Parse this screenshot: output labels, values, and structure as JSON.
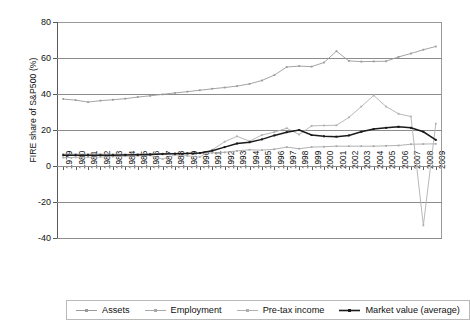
{
  "chart_data": {
    "type": "line",
    "title": "",
    "xlabel": "",
    "ylabel": "FIRE share of S&P500 (%)",
    "ylim": [
      -40,
      80
    ],
    "yticks": [
      80,
      60,
      40,
      20,
      0,
      -20,
      -40
    ],
    "grid": true,
    "legend_position": "bottom",
    "x": [
      1979,
      1980,
      1981,
      1982,
      1983,
      1984,
      1985,
      1986,
      1987,
      1988,
      1989,
      1990,
      1991,
      1992,
      1993,
      1994,
      1995,
      1996,
      1997,
      1998,
      1999,
      2000,
      2001,
      2002,
      2003,
      2004,
      2005,
      2006,
      2007,
      2008,
      2009
    ],
    "categories": [
      "1979",
      "1980",
      "1981",
      "1982",
      "1983",
      "1984",
      "1985",
      "1986",
      "1987",
      "1988",
      "1989",
      "1990",
      "1991",
      "1992",
      "1993",
      "1994",
      "1995",
      "1996",
      "1997",
      "1998",
      "1999",
      "2000",
      "2001",
      "2002",
      "2003",
      "2004",
      "2005",
      "2006",
      "2007",
      "2008",
      "2009"
    ],
    "series": [
      {
        "name": "Assets",
        "color": "#9a9a9a",
        "values": [
          37.2,
          36.6,
          35.5,
          36.3,
          36.8,
          37.4,
          38.3,
          39.0,
          39.8,
          40.6,
          41.3,
          42.1,
          42.9,
          43.6,
          44.4,
          45.6,
          47.5,
          50.5,
          55.0,
          55.5,
          55.2,
          57.5,
          63.8,
          58.4,
          58.0,
          58.1,
          58.2,
          60.6,
          62.5,
          64.6,
          66.4
        ]
      },
      {
        "name": "Employment",
        "color": "#a8a8a8",
        "values": [
          6.6,
          6.6,
          6.6,
          6.6,
          6.5,
          6.5,
          6.6,
          6.8,
          6.9,
          7.0,
          7.0,
          7.1,
          7.3,
          7.6,
          8.4,
          9.0,
          8.8,
          9.3,
          10.5,
          9.6,
          10.5,
          10.7,
          11.0,
          11.0,
          11.0,
          11.0,
          11.2,
          11.4,
          12.1,
          12.2,
          12.3
        ]
      },
      {
        "name": "Pre-tax income",
        "color": "#b0b0b0",
        "values": [
          4.6,
          4.8,
          4.9,
          5.0,
          5.2,
          5.4,
          5.6,
          5.9,
          3.8,
          6.1,
          5.6,
          5.0,
          9.0,
          13.5,
          16.5,
          13.8,
          17.2,
          18.8,
          21.0,
          17.5,
          22.3,
          22.5,
          22.6,
          27.0,
          33.0,
          39.2,
          33.0,
          29.0,
          27.5,
          31.0,
          23.5
        ]
      },
      {
        "name": "Market value (average)",
        "color": "#1a1a1a",
        "values": [
          6.0,
          6.0,
          6.0,
          6.0,
          6.0,
          6.1,
          6.2,
          6.4,
          6.6,
          6.8,
          7.0,
          7.2,
          8.5,
          10.5,
          12.5,
          13.2,
          14.8,
          17.0,
          18.8,
          20.0,
          17.2,
          16.5,
          16.3,
          17.0,
          19.0,
          20.5,
          21.2,
          21.8,
          21.2,
          19.0,
          14.5
        ]
      }
    ],
    "annotations": [
      {
        "series": "Pre-tax income",
        "x": 2008,
        "y": -33.0,
        "note": "sharp decline"
      }
    ]
  },
  "legend": {
    "items": [
      {
        "label": "Assets",
        "marker": "line-with-square-marker"
      },
      {
        "label": "Employment",
        "marker": "line-with-square-marker"
      },
      {
        "label": "Pre-tax income",
        "marker": "line-with-square-marker"
      },
      {
        "label": "Market value (average)",
        "marker": "line-with-square-marker"
      }
    ]
  }
}
